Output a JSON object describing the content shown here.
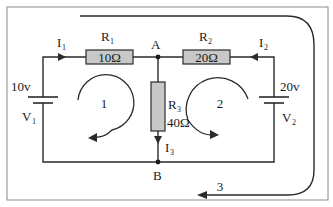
{
  "diagram": {
    "type": "circuit",
    "colors": {
      "wire": "#2a2a2a",
      "resistor_fill": "#c8c8c8",
      "frame": "#8a8a8a",
      "background": "#ffffff"
    },
    "nodes": {
      "A": "A",
      "B": "B"
    },
    "resistors": {
      "r1": {
        "name": "R",
        "sub": "1",
        "value": "10Ω"
      },
      "r2": {
        "name": "R",
        "sub": "2",
        "value": "20Ω"
      },
      "r3": {
        "name": "R",
        "sub": "3",
        "value": "40Ω"
      }
    },
    "sources": {
      "v1": {
        "voltage": "10v",
        "name": "V",
        "sub": "1"
      },
      "v2": {
        "voltage": "20v",
        "name": "V",
        "sub": "2"
      }
    },
    "currents": {
      "i1": {
        "name": "I",
        "sub": "1"
      },
      "i2": {
        "name": "I",
        "sub": "2"
      },
      "i3": {
        "name": "I",
        "sub": "3"
      }
    },
    "loops": {
      "loop1": "1",
      "loop2": "2",
      "loop3": "3"
    }
  }
}
